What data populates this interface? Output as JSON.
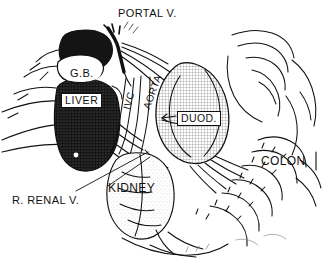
{
  "figure": {
    "colors": {
      "ink": "#111111",
      "paper": "#ffffff",
      "liver_fill": "#1a1a1a",
      "duodenum_fill": "#d2d2d2",
      "organ_fill": "#ffffff"
    }
  },
  "labels": {
    "portal_vein": "PORTAL V.",
    "gallbladder": "G.B.",
    "liver": "LIVER",
    "ivc": "IVC",
    "aorta": "AORTA",
    "duodenum": "DUOD.",
    "colon": "COLON",
    "kidney": "KIDNEY",
    "right_renal_vein": "R. RENAL V."
  },
  "structures": [
    {
      "name": "portal-vein",
      "label": "PORTAL V.",
      "shading": "solid-black-vessel"
    },
    {
      "name": "gallbladder",
      "label": "G.B.",
      "shading": "white-outline"
    },
    {
      "name": "liver",
      "label": "LIVER",
      "shading": "dark-stipple"
    },
    {
      "name": "inferior-vena-cava",
      "label": "IVC",
      "shading": "white-outline-vessel"
    },
    {
      "name": "aorta",
      "label": "AORTA",
      "shading": "white-outline-vessel"
    },
    {
      "name": "duodenum",
      "label": "DUOD.",
      "shading": "cross-hatch"
    },
    {
      "name": "kidney",
      "label": "KIDNEY",
      "shading": "fine-stipple"
    },
    {
      "name": "colon",
      "label": "COLON",
      "shading": "white-outline"
    }
  ]
}
